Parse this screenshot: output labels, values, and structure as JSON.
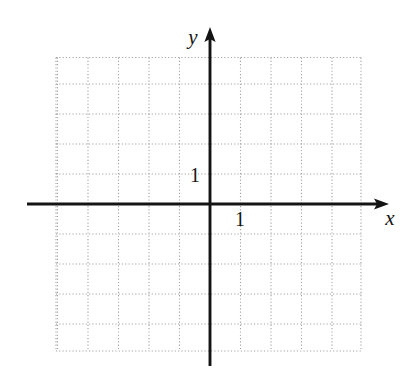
{
  "figure": {
    "kind": "blank-coordinate-plane"
  },
  "labels": {
    "x_axis": "x",
    "y_axis": "y",
    "x_unit_tick": "1",
    "y_unit_tick": "1"
  },
  "colors": {
    "background": "#ffffff",
    "axis": "#141414",
    "grid": "#9a9a9a",
    "text": "#151515"
  },
  "chart_data": {
    "type": "scatter",
    "title": "",
    "subtitle": "",
    "xlabel": "x",
    "ylabel": "y",
    "x": [],
    "y": [],
    "series": [],
    "annotations": [
      {
        "text": "1",
        "role": "x-unit-tick",
        "x": 1,
        "y": 0
      },
      {
        "text": "1",
        "role": "y-unit-tick",
        "x": 0,
        "y": 1
      }
    ],
    "legend": [],
    "legend_position": "none",
    "grid": true,
    "grid_style": "dotted",
    "grid_step": 1,
    "xlim": [
      -5,
      5
    ],
    "ylim": [
      -5,
      5
    ],
    "xticks": [
      -5,
      -4,
      -3,
      -2,
      -1,
      0,
      1,
      2,
      3,
      4,
      5
    ],
    "yticks": [
      -5,
      -4,
      -3,
      -2,
      -1,
      0,
      1,
      2,
      3,
      4,
      5
    ],
    "xtick_labels": [
      "",
      "",
      "",
      "",
      "",
      "",
      "1",
      "",
      "",
      "",
      ""
    ],
    "ytick_labels": [
      "",
      "",
      "",
      "",
      "",
      "",
      "1",
      "",
      "",
      "",
      ""
    ],
    "axis_arrows": [
      "x-positive",
      "y-positive"
    ],
    "note": "Empty grid; no data plotted."
  },
  "geometry": {
    "grid_left": 56,
    "grid_top": 57.5,
    "grid_right": 361,
    "grid_bottom": 351,
    "origin_x": 210,
    "origin_y": 204,
    "cell_width": 30.5,
    "cell_height": 30.0,
    "x_axis_start": 27,
    "x_axis_end": 386,
    "y_axis_top": 30,
    "y_axis_bottom": 366
  }
}
